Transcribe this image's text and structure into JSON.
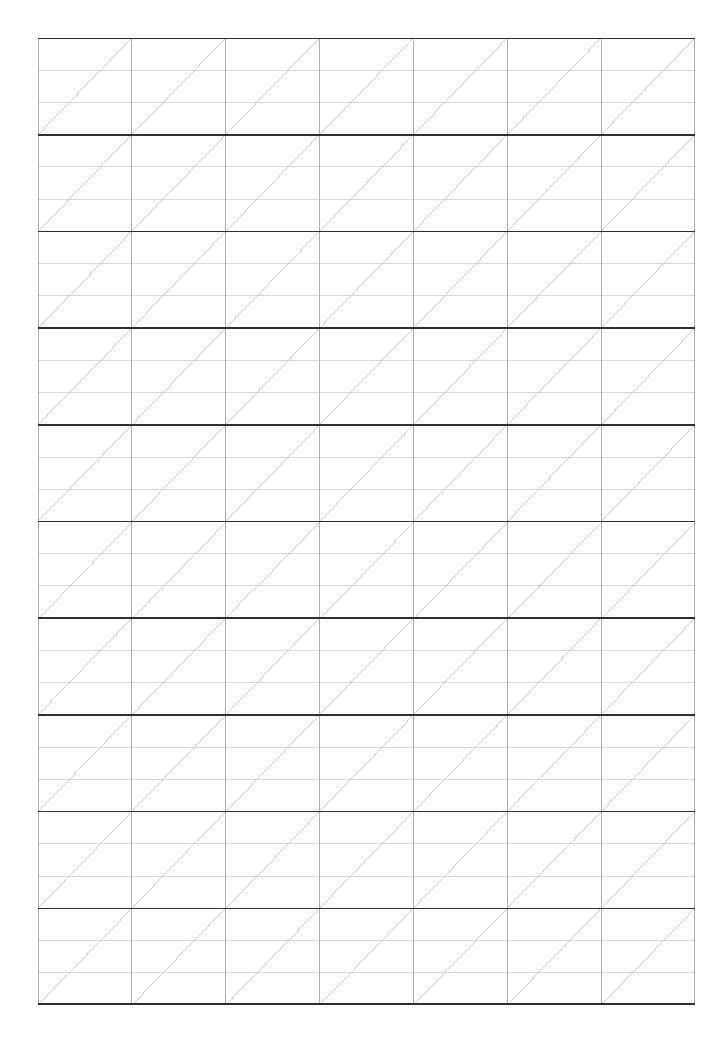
{
  "page": {
    "width": 727,
    "height": 1051,
    "background_color": "#ffffff"
  },
  "header": {
    "ghost_text": "▫ ▫▫ ▫▫▫ ▫ ▫▫",
    "note": "partially cropped faint header artifact at top edge"
  },
  "grid": {
    "label": "handwriting practice grid",
    "origin_x": 38,
    "origin_y": 38,
    "width": 657,
    "height": 967,
    "columns": 7,
    "major_rows": 10,
    "sub_lines_per_row": 2,
    "cell_width": 93.857,
    "cell_height": 96.7,
    "diagonal_direction": "bottom-left-to-top-right",
    "colors": {
      "major_horizontal": "#2f2f2f",
      "minor_horizontal": "#c9c9c9",
      "vertical": "#9a9a9a",
      "diagonal": "#c4c4c4",
      "background": "#ffffff"
    },
    "stroke_widths": {
      "major_horizontal": 1.6,
      "minor_horizontal": 0.7,
      "vertical": 0.8,
      "diagonal": 0.8
    }
  }
}
